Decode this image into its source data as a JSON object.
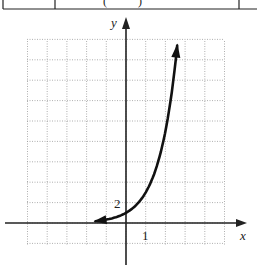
{
  "table_fragment": {
    "cells": [
      "",
      "( )",
      ""
    ],
    "note": "cropped table row at top of image"
  },
  "chart_data": {
    "type": "line",
    "title": "",
    "xlabel": "x",
    "ylabel": "y",
    "function_estimate": "y = 3^x (exponential growth, y-intercept ≈ 1)",
    "tick_labels": {
      "x": [
        "1"
      ],
      "y": [
        "2"
      ]
    },
    "x_scale_per_grid": 1,
    "y_scale_per_grid": 2,
    "grid": true,
    "grid_style": "dotted",
    "xlim": [
      -5,
      5
    ],
    "ylim": [
      -2,
      18
    ],
    "series": [
      {
        "name": "curve",
        "x": [
          -1.55,
          -1,
          -0.5,
          0,
          0.5,
          1,
          1.5,
          2,
          2.3,
          2.6
        ],
        "y": [
          0.18,
          0.33,
          0.58,
          1,
          1.73,
          3,
          5.2,
          9,
          12.5,
          17.4
        ],
        "arrows": [
          "left-end",
          "right-end"
        ]
      }
    ],
    "colors": {
      "curve": "#111111",
      "axes": "#222222",
      "grid": "#9a9a9a"
    }
  }
}
